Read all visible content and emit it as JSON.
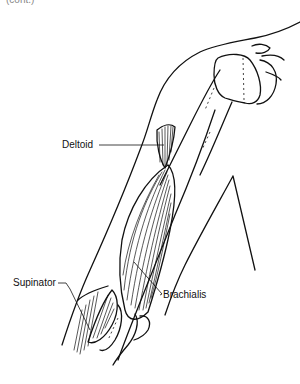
{
  "figure": {
    "top_clipped_text": "(cont.)",
    "labels": {
      "deltoid": "Deltoid",
      "supinator": "Supinator",
      "brachialis": "Brachialis"
    },
    "line_color": "#111111",
    "background": "#ffffff"
  }
}
